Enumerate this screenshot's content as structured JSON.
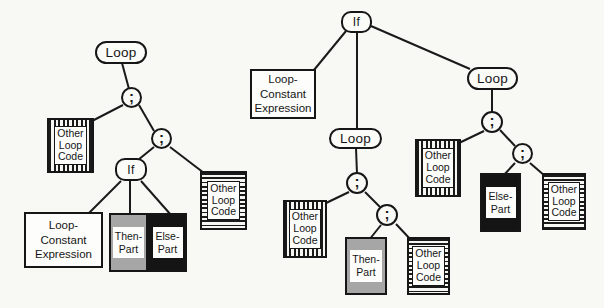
{
  "styles": {
    "background": "#f8f8f5",
    "line_color": "#1a1a1a",
    "then_part_fill": "#a6a6a6",
    "else_part_fill": "#141414",
    "stripe_color": "#1a1a1a",
    "other_loop_code_before_pattern": "vertical-stripes",
    "other_loop_code_after_pattern": "horizontal-stripes"
  },
  "left_tree": {
    "loop": "Loop",
    "semicolon_top": ";",
    "semicolon_inner": ";",
    "if": "If",
    "other_loop_code_before": "Other\nLoop\nCode",
    "other_loop_code_after": "Other\nLoop\nCode",
    "loop_constant_expression": "Loop-\nConstant\nExpression",
    "then_part": "Then-\nPart",
    "else_part": "Else-\nPart"
  },
  "right_tree": {
    "if": "If",
    "loop_constant_expression": "Loop-\nConstant\nExpression",
    "then_loop": {
      "loop": "Loop",
      "semicolon_top": ";",
      "semicolon_inner": ";",
      "other_loop_code_before": "Other\nLoop\nCode",
      "then_part": "Then-\nPart",
      "other_loop_code_after": "Other\nLoop\nCode"
    },
    "else_loop": {
      "loop": "Loop",
      "semicolon_top": ";",
      "semicolon_inner": ";",
      "other_loop_code_before": "Other\nLoop\nCode",
      "else_part": "Else-\nPart",
      "other_loop_code_after": "Other\nLoop\nCode"
    }
  }
}
